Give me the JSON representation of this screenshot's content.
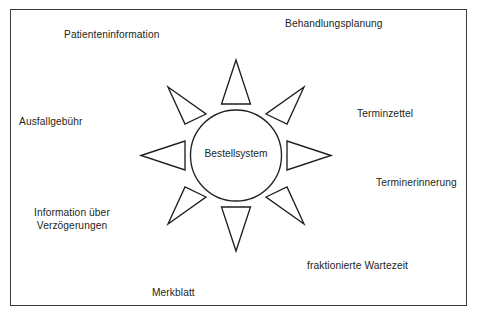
{
  "diagram": {
    "type": "sun-radial-diagram",
    "border_color": "#3a3a3a",
    "stroke_color": "#231f20",
    "background_color": "#ffffff",
    "center": {
      "label": "Bestellsystem",
      "shape": "circle"
    },
    "rays": {
      "count": 8,
      "shape": "triangle",
      "directions": [
        "north",
        "northeast",
        "east",
        "southeast",
        "south",
        "southwest",
        "west",
        "northwest"
      ]
    },
    "labels": [
      {
        "id": "patienteninformation",
        "text": "Patienteninformation",
        "position": "top-left"
      },
      {
        "id": "behandlungsplanung",
        "text": "Behandlungsplanung",
        "position": "top-right"
      },
      {
        "id": "terminzettel",
        "text": "Terminzettel",
        "position": "right-upper"
      },
      {
        "id": "terminerinnerung",
        "text": "Terminerinnerung",
        "position": "right-lower"
      },
      {
        "id": "fraktionierte-wartezeit",
        "text": "fraktionierte Wartezeit",
        "position": "bottom-right"
      },
      {
        "id": "merkblatt",
        "text": "Merkblatt",
        "position": "bottom-left"
      },
      {
        "id": "information-ueber-verzoegerungen",
        "text": "Information über\nVerzögerungen",
        "line1": "Information über",
        "line2": "Verzögerungen",
        "position": "left-lower"
      },
      {
        "id": "ausfallgebuehr",
        "text": "Ausfallgebühr",
        "position": "left-upper"
      }
    ]
  }
}
